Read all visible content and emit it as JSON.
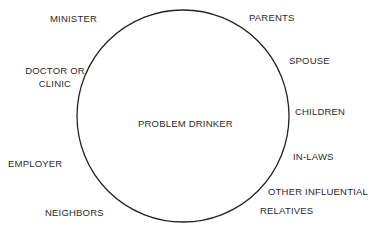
{
  "diagram": {
    "center_label": "PROBLEM DRINKER",
    "left_labels": [
      {
        "text": "MINISTER"
      },
      {
        "text_line1": "DOCTOR OR",
        "text_line2": "CLINIC"
      },
      {
        "text": "EMPLOYER"
      },
      {
        "text": "NEIGHBORS"
      }
    ],
    "right_labels": [
      {
        "text": "PARENTS"
      },
      {
        "text": "SPOUSE"
      },
      {
        "text": "CHILDREN"
      },
      {
        "text": "IN-LAWS"
      },
      {
        "text_line1": "OTHER INFLUENTIAL",
        "text_line2": "RELATIVES"
      }
    ]
  }
}
